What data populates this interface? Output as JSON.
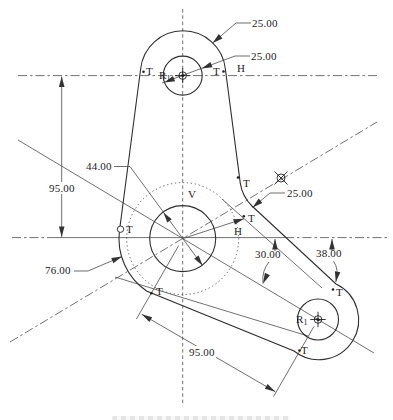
{
  "drawing": {
    "type": "engineering-tangency-construction",
    "dimensions": {
      "top_lobe_radius": "25.00",
      "top_hole_diameter": "25.00",
      "fillet_radius": "25.00",
      "center_hole_diameter": "44.00",
      "boss_diameter": "76.00",
      "vertical_center_distance": "95.00",
      "arm_center_distance": "95.00",
      "centerline_angle": "30.00",
      "tangent_angle": "38.00"
    },
    "axes": {
      "horizontal": "H",
      "vertical": "V"
    },
    "markers": {
      "tangent": "T",
      "radius_base": "R",
      "radius_sub": "1"
    },
    "colors": {
      "outline": "#2f2f2f",
      "construction": "#4d4d4d",
      "background": "#ffffff"
    }
  }
}
